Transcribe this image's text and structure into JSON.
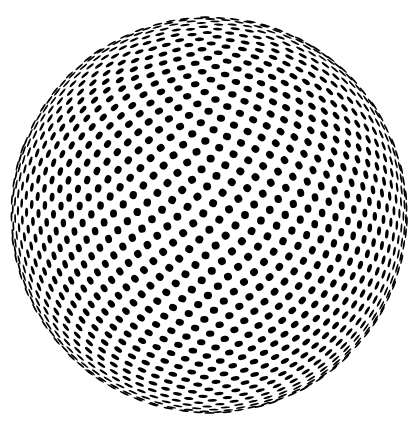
{
  "figure": {
    "name": "halftone-dot-sphere",
    "background_color": "#ffffff",
    "dot_color": "#000000",
    "canvas": {
      "width": 418,
      "height": 423
    },
    "sphere": {
      "center_x": 209,
      "center_y": 215,
      "radius": 198,
      "total_points": 2200,
      "golden_angle_rad": 2.399963229728653,
      "tilt_deg": 12,
      "dot_radius": 4.0,
      "edge_growth": 0.25,
      "min_dot_thickness": 0.9,
      "min_visible_z": 0.015
    }
  }
}
